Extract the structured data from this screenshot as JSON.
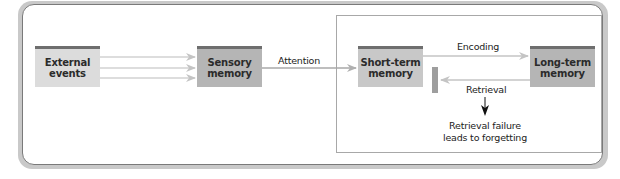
{
  "diagram": {
    "nodes": {
      "external_events": {
        "line1": "External",
        "line2": "events",
        "color": "#dcdcdc"
      },
      "sensory_memory": {
        "line1": "Sensory",
        "line2": "memory",
        "color": "#b5b5b5"
      },
      "short_term_memory": {
        "line1": "Short-term",
        "line2": "memory",
        "color": "#c8c8c8"
      },
      "long_term_memory": {
        "line1": "Long-term",
        "line2": "memory",
        "color": "#b5b5b5"
      }
    },
    "edges": {
      "attention": "Attention",
      "encoding": "Encoding",
      "retrieval": "Retrieval"
    },
    "annotation": {
      "line1": "Retrieval failure",
      "line2": "leads to forgetting"
    },
    "colors": {
      "arrow": "#c4c4c4",
      "attention_line": "#a8a8a8",
      "frame_border": "#7a7a7a",
      "box_top_bar": "#6e6e6e"
    }
  }
}
